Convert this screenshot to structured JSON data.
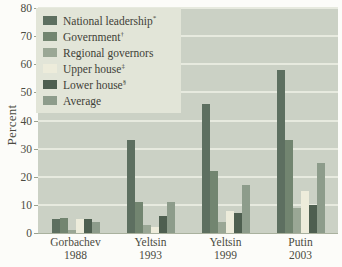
{
  "figure": {
    "background": "#fcfcf9",
    "text_color": "#4b4b41"
  },
  "chart_data": {
    "type": "bar",
    "title": "",
    "xlabel": "",
    "ylabel": "Percent",
    "ylim": [
      0,
      80
    ],
    "yticks": [
      0,
      10,
      20,
      30,
      40,
      50,
      60,
      70,
      80
    ],
    "grid": true,
    "legend_position": "upper-left",
    "plot_bg": "#cbd1c5",
    "gridline_color": "#e7eadf",
    "legend_bg": "#e2e5d8",
    "categories": [
      {
        "line1": "Gorbachev",
        "line2": "1988"
      },
      {
        "line1": "Yeltsin",
        "line2": "1993"
      },
      {
        "line1": "Yeltsin",
        "line2": "1999"
      },
      {
        "line1": "Putin",
        "line2": "2003"
      }
    ],
    "series": [
      {
        "name": "National leadership",
        "note_mark": "*",
        "color": "#5d6f60",
        "values": [
          5,
          33,
          46,
          58
        ]
      },
      {
        "name": "Government",
        "note_mark": "†",
        "color": "#728570",
        "values": [
          5.5,
          11,
          22,
          33
        ]
      },
      {
        "name": "Regional governors",
        "note_mark": "",
        "color": "#9aa795",
        "values": [
          1,
          3,
          4,
          9
        ]
      },
      {
        "name": "Upper house",
        "note_mark": "‡",
        "color": "#edecdb",
        "values": [
          5,
          2,
          8,
          15
        ]
      },
      {
        "name": "Lower house",
        "note_mark": "§",
        "color": "#4e5f50",
        "values": [
          5,
          6,
          7,
          10
        ]
      },
      {
        "name": "Average",
        "note_mark": "",
        "color": "#8d9c8b",
        "values": [
          4,
          11,
          17,
          25
        ]
      }
    ]
  }
}
